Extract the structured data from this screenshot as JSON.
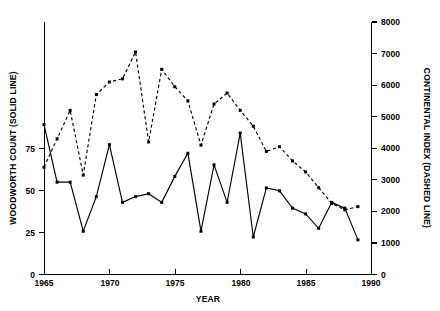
{
  "chart_data": {
    "type": "line",
    "title": "",
    "subtitle": "",
    "xlabel": "YEAR",
    "ylabel": "WOODWORTH COUNT (SOLID LINE)",
    "y2label": "CONTINENTAL INDEX (DASHED LINE)",
    "xlim": [
      1965,
      1990
    ],
    "ylim": [
      0,
      87.5
    ],
    "y2lim": [
      0,
      8000
    ],
    "grid": false,
    "legend": "none",
    "xticks": [
      1965,
      1970,
      1975,
      1980,
      1985,
      1990
    ],
    "xtick_labels": [
      "1965",
      "1970",
      "1975",
      "1980",
      "1985",
      "1990"
    ],
    "yticks": [
      0,
      25,
      50,
      75
    ],
    "ytick_labels": [
      "0",
      "25",
      "50",
      "75"
    ],
    "y2ticks": [
      0,
      1000,
      2000,
      3000,
      4000,
      5000,
      6000,
      7000,
      8000
    ],
    "y2tick_labels": [
      "0",
      "1000",
      "2000",
      "3000",
      "4000",
      "5000",
      "6000",
      "7000",
      "8000"
    ],
    "x": [
      1965,
      1966,
      1967,
      1968,
      1969,
      1970,
      1971,
      1972,
      1973,
      1974,
      1975,
      1976,
      1977,
      1978,
      1979,
      1980,
      1981,
      1982,
      1983,
      1984,
      1985,
      1986,
      1987,
      1988,
      1989
    ],
    "series": [
      {
        "name": "WOODWORTH COUNT (SOLID LINE)",
        "axis": "left",
        "style": "solid",
        "markers": true,
        "values": [
          52,
          32,
          32,
          15,
          27,
          45,
          25,
          27,
          28,
          25,
          34,
          42,
          15,
          38,
          25,
          49,
          13,
          30,
          29,
          23,
          21,
          16,
          25,
          23,
          12
        ]
      },
      {
        "name": "CONTINENTAL INDEX (DASHED LINE)",
        "axis": "right",
        "style": "dashed",
        "markers": true,
        "values": [
          3400,
          4300,
          5200,
          3150,
          5700,
          6100,
          6200,
          7050,
          4200,
          6500,
          5950,
          5500,
          4100,
          5400,
          5750,
          5200,
          4700,
          3900,
          4050,
          3600,
          3250,
          2750,
          2250,
          2050,
          2150
        ]
      }
    ]
  }
}
